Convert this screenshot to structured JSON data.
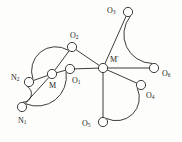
{
  "diagram": {
    "type": "chemical-structure-graph",
    "colors": {
      "stroke": "#2a2724",
      "node_fill": "#ffffff",
      "background": "#fdfdfc",
      "label": "#262320"
    },
    "canvas": {
      "width": 182,
      "height": 142
    },
    "node_radius": 4.6,
    "atoms": [
      {
        "id": "N2",
        "base": "N",
        "sub": "2",
        "prime": "",
        "cx": 29,
        "cy": 82,
        "label_x": 11,
        "label_y": 78,
        "anchor": "start"
      },
      {
        "id": "N1",
        "base": "N",
        "sub": "1",
        "prime": "",
        "cx": 22,
        "cy": 107,
        "label_x": 18,
        "label_y": 121,
        "anchor": "start"
      },
      {
        "id": "M",
        "base": "M",
        "sub": "",
        "prime": "",
        "cx": 52,
        "cy": 74,
        "label_x": 49,
        "label_y": 86,
        "anchor": "start"
      },
      {
        "id": "O1",
        "base": "O",
        "sub": "1",
        "prime": "",
        "cx": 70,
        "cy": 69,
        "label_x": 72,
        "label_y": 81,
        "anchor": "start"
      },
      {
        "id": "O2",
        "base": "O",
        "sub": "2",
        "prime": "",
        "cx": 72,
        "cy": 47,
        "label_x": 70,
        "label_y": 36,
        "anchor": "start"
      },
      {
        "id": "Mp",
        "base": "M",
        "sub": "",
        "prime": "'",
        "cx": 103,
        "cy": 68,
        "label_x": 110,
        "label_y": 60,
        "anchor": "start"
      },
      {
        "id": "O3",
        "base": "O",
        "sub": "3",
        "prime": "",
        "cx": 128,
        "cy": 12,
        "label_x": 107,
        "label_y": 11,
        "anchor": "start"
      },
      {
        "id": "O6",
        "base": "O",
        "sub": "6",
        "prime": "",
        "cx": 154,
        "cy": 68,
        "label_x": 162,
        "label_y": 74,
        "anchor": "start"
      },
      {
        "id": "O4",
        "base": "O",
        "sub": "4",
        "prime": "",
        "cx": 141,
        "cy": 85,
        "label_x": 146,
        "label_y": 96,
        "anchor": "start"
      },
      {
        "id": "O5",
        "base": "O",
        "sub": "5",
        "prime": "",
        "cx": 103,
        "cy": 122,
        "label_x": 82,
        "label_y": 124,
        "anchor": "start"
      }
    ],
    "bonds_straight": [
      {
        "id": "N2-M",
        "from": "N2",
        "to": "M"
      },
      {
        "id": "N1-M",
        "from": "N1",
        "to": "M"
      },
      {
        "id": "M-O1",
        "from": "M",
        "to": "O1"
      },
      {
        "id": "O1-Mp",
        "from": "O1",
        "to": "Mp"
      },
      {
        "id": "O2-M",
        "from": "O2",
        "to": "M"
      },
      {
        "id": "O2-Mp",
        "from": "O2",
        "to": "Mp"
      },
      {
        "id": "Mp-O3",
        "from": "Mp",
        "to": "O3"
      },
      {
        "id": "Mp-O6",
        "from": "Mp",
        "to": "O6"
      },
      {
        "id": "Mp-O4",
        "from": "Mp",
        "to": "O4"
      },
      {
        "id": "Mp-O5",
        "from": "Mp",
        "to": "O5"
      }
    ],
    "bonds_arc": [
      {
        "id": "N2-O2-arc",
        "from": "N2",
        "to": "O2",
        "bulge": 16,
        "sweep": 1
      },
      {
        "id": "N2-N1-arc",
        "from": "N2",
        "to": "N1",
        "bulge": 11,
        "sweep": 1
      },
      {
        "id": "N1-O1-arc",
        "from": "N1",
        "to": "O1",
        "bulge": 15,
        "sweep": 0
      },
      {
        "id": "O3-O6-arc",
        "from": "O3",
        "to": "O6",
        "bulge": 16,
        "sweep": 0
      },
      {
        "id": "O5-O4-arc",
        "from": "O5",
        "to": "O4",
        "bulge": 15,
        "sweep": 0
      }
    ]
  }
}
